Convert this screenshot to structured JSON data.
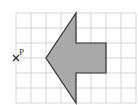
{
  "diagram": {
    "grid": {
      "columns": 8,
      "rows": 6,
      "line_color": "#c8c8c8"
    },
    "shape": {
      "name": "arrow",
      "fill": "#a9a9a9",
      "stroke": "#333333",
      "vertices_grid": [
        [
          4,
          0
        ],
        [
          4,
          2
        ],
        [
          6,
          2
        ],
        [
          6,
          4
        ],
        [
          4,
          4
        ],
        [
          4,
          6
        ],
        [
          2,
          3
        ]
      ]
    },
    "point": {
      "label": "P",
      "grid": [
        0,
        3
      ],
      "marker": "cross"
    }
  }
}
